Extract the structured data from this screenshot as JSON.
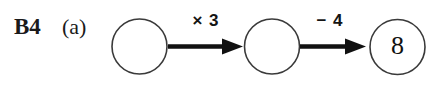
{
  "worksheet": {
    "question_number": "B4",
    "part_label": "(a)",
    "background_color": "#ffffff",
    "ink_color": "#111111"
  },
  "diagram": {
    "type": "function-machine-chain",
    "nodes": [
      {
        "id": "node-1",
        "value": "",
        "empty": true
      },
      {
        "id": "node-2",
        "value": "",
        "empty": true
      },
      {
        "id": "node-3",
        "value": "8",
        "empty": false
      }
    ],
    "operations": [
      {
        "id": "op-1",
        "label": "× 3",
        "from": "node-1",
        "to": "node-2"
      },
      {
        "id": "op-2",
        "label": "− 4",
        "from": "node-2",
        "to": "node-3"
      }
    ]
  }
}
